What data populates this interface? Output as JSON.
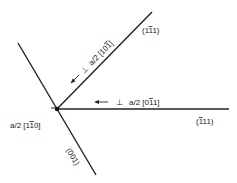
{
  "diagram": {
    "planes": [
      {
        "id": "plane-1-1bar-1",
        "label_parts": [
          {
            "t": "(1",
            "bar": false
          },
          {
            "t": "1",
            "bar": true
          },
          {
            "t": "1)",
            "bar": false
          }
        ]
      },
      {
        "id": "plane-1bar-1-1",
        "label_parts": [
          {
            "t": "(",
            "bar": false
          },
          {
            "t": "1",
            "bar": true
          },
          {
            "t": "11)",
            "bar": false
          }
        ]
      },
      {
        "id": "plane-001",
        "label": "(001)"
      }
    ],
    "dislocations": [
      {
        "id": "disl-101bar",
        "symbol": "⊥",
        "prefix": "a/2 [",
        "indices": [
          {
            "t": "10",
            "bar": false
          },
          {
            "t": "1",
            "bar": true
          }
        ],
        "suffix": "]"
      },
      {
        "id": "disl-01bar1",
        "symbol": "⊥",
        "prefix": "a/2 [",
        "indices": [
          {
            "t": "0",
            "bar": false
          },
          {
            "t": "1",
            "bar": true
          },
          {
            "t": "1",
            "bar": false
          }
        ],
        "suffix": "]"
      },
      {
        "id": "disl-11bar0",
        "prefix": "a/2 [",
        "indices": [
          {
            "t": "1",
            "bar": false
          },
          {
            "t": "1",
            "bar": true
          },
          {
            "t": "0",
            "bar": false
          }
        ],
        "suffix": "]"
      }
    ],
    "line_color": "#222222"
  }
}
